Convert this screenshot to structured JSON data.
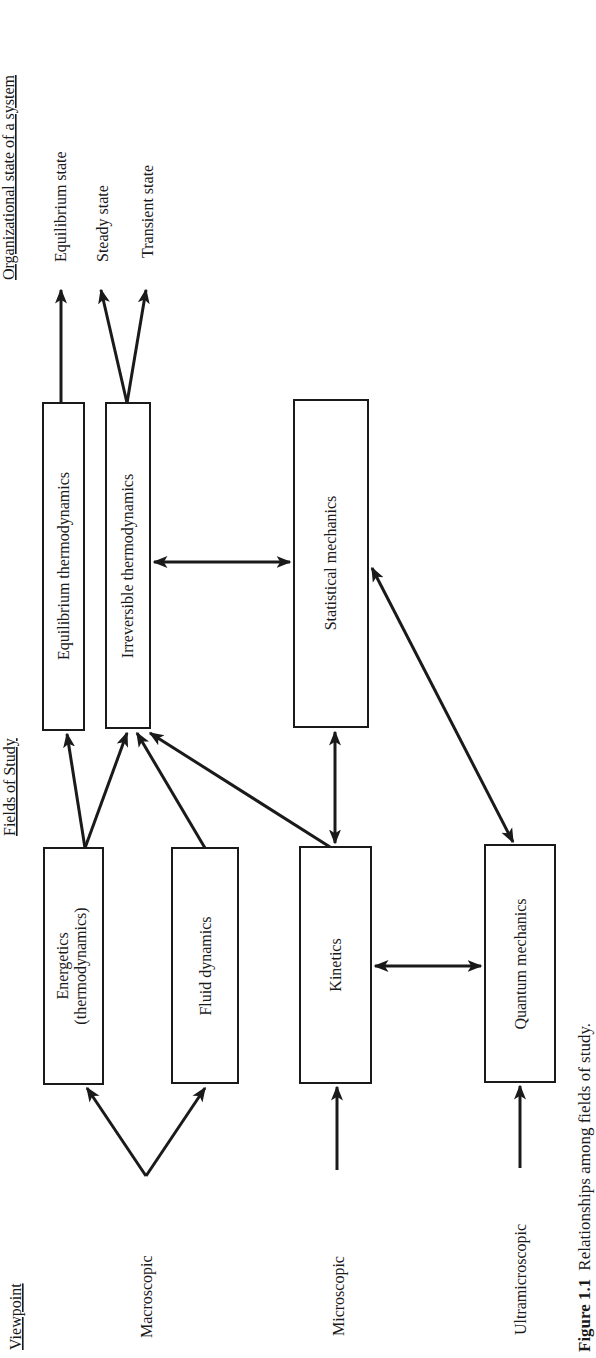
{
  "headers": {
    "viewpoint": "Viewpoint",
    "fields_of_study": "Fields of Study",
    "organizational_state": "Organizational state of a system"
  },
  "viewpoints": [
    {
      "label": "Macroscopic"
    },
    {
      "label": "Microscopic"
    },
    {
      "label": "Ultramicroscopic"
    }
  ],
  "fields": {
    "energetics": {
      "line1": "Energetics",
      "line2": "(thermodynamics)"
    },
    "fluid_dynamics": "Fluid dynamics",
    "kinetics": "Kinetics",
    "quantum_mechanics": "Quantum mechanics",
    "equilibrium_thermo": "Equilibrium thermodynamics",
    "irreversible_thermo": "Irreversible thermodynamics",
    "statistical_mechanics": "Statistical mechanics"
  },
  "states": [
    {
      "label": "Equilibrium state"
    },
    {
      "label": "Steady state"
    },
    {
      "label": "Transient state"
    }
  ],
  "caption": {
    "number": "Figure 1.1",
    "text": "Relationships among fields of study."
  },
  "colors": {
    "ink": "#1a1a1a",
    "background": "#ffffff"
  }
}
